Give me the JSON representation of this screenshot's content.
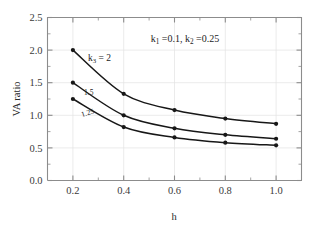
{
  "chart_data": {
    "type": "line",
    "title": "",
    "xlabel": "h",
    "ylabel": "VA ratio",
    "xlim": [
      0.1,
      1.1
    ],
    "ylim": [
      0.0,
      2.5
    ],
    "grid": true,
    "legend_position": "inline-curve-labels",
    "x": [
      0.2,
      0.4,
      0.6,
      0.8,
      1.0
    ],
    "xticks": [
      "0.2",
      "0.4",
      "0.6",
      "0.8",
      "1.0"
    ],
    "xtick_values": [
      0.2,
      0.4,
      0.6,
      0.8,
      1.0
    ],
    "yticks": [
      "0.0",
      "0.5",
      "1.0",
      "1.5",
      "2.0",
      "2.5"
    ],
    "ytick_values": [
      0.0,
      0.5,
      1.0,
      1.5,
      2.0,
      2.5
    ],
    "series": [
      {
        "name": "k3 = 2",
        "label": "k",
        "label_sub": "3",
        "label_rest": " = 2",
        "values": [
          2.0,
          1.33,
          1.08,
          0.95,
          0.87
        ]
      },
      {
        "name": "k3 = 1.5",
        "label": "1.5",
        "values": [
          1.5,
          1.0,
          0.8,
          0.7,
          0.64
        ]
      },
      {
        "name": "k3 = 1.25",
        "label": "1.25",
        "values": [
          1.25,
          0.82,
          0.66,
          0.58,
          0.54
        ]
      }
    ],
    "annotations": [
      {
        "id": "parameters",
        "text": "k1 =0.1, k2 =0.25",
        "parts": {
          "k1": "k",
          "k1_sub": "1",
          "k1_val": " =0.1, ",
          "k2": "k",
          "k2_sub": "2",
          "k2_val": " =0.25"
        }
      }
    ],
    "colors": {
      "line": "#171717",
      "marker": "#171717",
      "axis": "#8c8c8c",
      "grid": "#e2e2e2",
      "background": "#ffffff"
    }
  }
}
